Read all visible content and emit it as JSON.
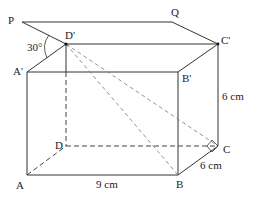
{
  "diagram": {
    "type": "cuboid-with-elevation-plane",
    "points": {
      "P": {
        "label": "P",
        "x": 22,
        "y": 22
      },
      "Q": {
        "label": "Q",
        "x": 172,
        "y": 22
      },
      "D_prime": {
        "label": "D'",
        "x": 66,
        "y": 44
      },
      "C_prime": {
        "label": "C'",
        "x": 218,
        "y": 44
      },
      "A_prime": {
        "label": "A'",
        "x": 27,
        "y": 72
      },
      "B_prime": {
        "label": "B'",
        "x": 178,
        "y": 72
      },
      "D": {
        "label": "D",
        "x": 66,
        "y": 146
      },
      "C": {
        "label": "C",
        "x": 218,
        "y": 146
      },
      "A": {
        "label": "A",
        "x": 27,
        "y": 175
      },
      "B": {
        "label": "B",
        "x": 178,
        "y": 175
      }
    },
    "dimensions": {
      "AB": "9 cm",
      "BC": "6 cm",
      "CC_prime": "6 cm"
    },
    "angle": {
      "label": "30°",
      "between": [
        "PD'",
        "D'A'"
      ]
    },
    "right_angle_at": "C"
  }
}
